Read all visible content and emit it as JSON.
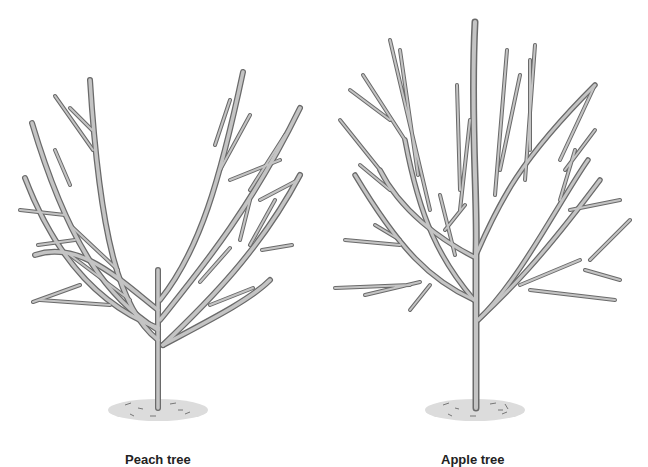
{
  "figure": {
    "trees": [
      {
        "id": "peach",
        "label": "Peach tree",
        "form": "open-center"
      },
      {
        "id": "apple",
        "label": "Apple tree",
        "form": "central-leader"
      }
    ]
  },
  "colors": {
    "background": "#ffffff",
    "branch_outline": "#6a6a6a",
    "branch_fill": "#c4c4c4",
    "ground": "#d9d9d9",
    "text": "#222222"
  }
}
